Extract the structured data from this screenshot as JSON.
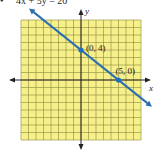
{
  "problem": {
    "bullet": "•",
    "equation": "4x + 5y = 20"
  },
  "colors": {
    "grid_fill": "#f7f08a",
    "grid_line": "#8a8a3a",
    "axis": "#222222",
    "line": "#2e6fb0",
    "point": "#1f6fc0"
  },
  "chart_data": {
    "type": "line",
    "title": "4x + 5y = 20",
    "xlabel": "x",
    "ylabel": "y",
    "xlim": [
      -8,
      8
    ],
    "ylim": [
      -8,
      8
    ],
    "grid": true,
    "series": [
      {
        "name": "4x + 5y = 20",
        "x": [
          -8,
          10
        ],
        "y": [
          10.4,
          -4
        ]
      }
    ],
    "points": [
      {
        "label": "(0, 4)",
        "x": 0,
        "y": 4
      },
      {
        "label": "(5, 0)",
        "x": 5,
        "y": 0
      }
    ]
  }
}
